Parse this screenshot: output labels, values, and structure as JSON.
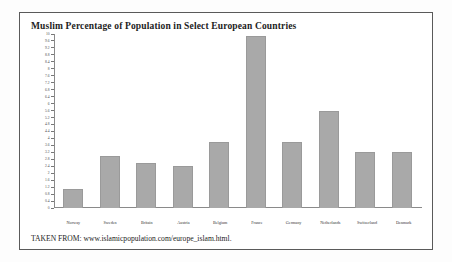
{
  "figure": {
    "title": "Muslim Percentage of Population in Select European Countries",
    "source_text": "TAKEN FROM: www.islamicpopulation.com/europe_islam.html.",
    "frame_color": "#5a5a5a",
    "bar_color": "#a9a9a9",
    "axis_color": "#8a8a8a",
    "background": "#ffffff"
  },
  "chart_data": {
    "type": "bar",
    "title": "Muslim Percentage of Population in Select European Countries",
    "xlabel": "",
    "ylabel": "",
    "ylim": [
      0,
      10
    ],
    "ytick_step": 0.4,
    "grid": false,
    "legend": "none",
    "categories": [
      "Norway",
      "Sweden",
      "Britain",
      "Austria",
      "Belgium",
      "France",
      "Germany",
      "Netherlands",
      "Switzerland",
      "Denmark"
    ],
    "values": [
      1.1,
      3.0,
      2.6,
      2.4,
      3.8,
      9.9,
      3.8,
      5.6,
      3.2,
      3.2
    ],
    "yticks": [
      "10",
      "9.6",
      "9.2",
      "8.8",
      "8.4",
      "8",
      "7.6",
      "7.2",
      "6.8",
      "6.4",
      "6",
      "5.6",
      "5.2",
      "4.8",
      "4.4",
      "4",
      "3.6",
      "3.2",
      "2.8",
      "2.4",
      "2",
      "1.6",
      "1.2",
      "0.8",
      "0.4",
      "0"
    ],
    "ytick_values": [
      10,
      9.6,
      9.2,
      8.8,
      8.4,
      8,
      7.6,
      7.2,
      6.8,
      6.4,
      6,
      5.6,
      5.2,
      4.8,
      4.4,
      4,
      3.6,
      3.2,
      2.8,
      2.4,
      2,
      1.6,
      1.2,
      0.8,
      0.4,
      0
    ],
    "annotations": [
      "TAKEN FROM: www.islamicpopulation.com/europe_islam.html."
    ]
  }
}
